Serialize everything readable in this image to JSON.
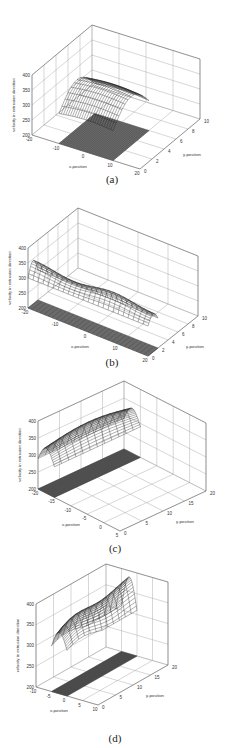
{
  "chart_data": [
    {
      "type": "surface3d",
      "caption": "(a)",
      "xlabel": "x-position",
      "ylabel": "y-position",
      "zlabel": "velocity in extrusion direction",
      "xlim": [
        -20,
        20
      ],
      "ylim": [
        0,
        10
      ],
      "zlim": [
        200,
        400
      ],
      "xticks": [
        -20,
        -10,
        0,
        10,
        20
      ],
      "yticks": [
        0,
        2,
        4,
        6,
        8,
        10
      ],
      "zticks": [
        200,
        250,
        300,
        350,
        400
      ],
      "surface": {
        "x_range": [
          -10,
          10
        ],
        "y_range": [
          0,
          6
        ],
        "z_edge": 300,
        "z_peak": 370,
        "shape": "arch"
      },
      "floor_patch": {
        "x_range": [
          -10,
          10
        ],
        "y_range": [
          0,
          6
        ]
      }
    },
    {
      "type": "surface3d",
      "caption": "(b)",
      "xlabel": "x-position",
      "ylabel": "y-position",
      "zlabel": "velocity in extrusion direction",
      "xlim": [
        -20,
        20
      ],
      "ylim": [
        0,
        10
      ],
      "zlim": [
        200,
        400
      ],
      "xticks": [
        -20,
        -10,
        0,
        10,
        20
      ],
      "yticks": [
        0,
        2,
        4,
        6,
        8,
        10
      ],
      "zticks": [
        200,
        250,
        300,
        350,
        400
      ],
      "surface": {
        "x_range": [
          -20,
          20
        ],
        "y_range": [
          0,
          2
        ],
        "z_edge": 300,
        "z_peak": 345,
        "shape": "wavy"
      },
      "floor_patch": {
        "x_range": [
          -20,
          20
        ],
        "y_range": [
          0,
          2
        ]
      }
    },
    {
      "type": "surface3d",
      "caption": "(c)",
      "xlabel": "x-position",
      "ylabel": "y-position",
      "zlabel": "velocity in extrusion direction",
      "xlim": [
        -20,
        5
      ],
      "ylim": [
        0,
        20
      ],
      "zlim": [
        200,
        400
      ],
      "xticks": [
        -20,
        -15,
        -10,
        -5,
        0,
        5
      ],
      "yticks": [
        0,
        5,
        10,
        15,
        20
      ],
      "zticks": [
        200,
        250,
        300,
        350,
        400
      ],
      "surface": {
        "x_range": [
          -20,
          -15
        ],
        "y_range": [
          0,
          20
        ],
        "z_edge": 290,
        "z_peak": 350,
        "shape": "arch-y"
      },
      "floor_patch": {
        "x_range": [
          -20,
          -15
        ],
        "y_range": [
          0,
          20
        ]
      }
    },
    {
      "type": "surface3d",
      "caption": "(d)",
      "xlabel": "x-position",
      "ylabel": "y-position",
      "zlabel": "velocity in extrusion direction",
      "xlim": [
        -10,
        10
      ],
      "ylim": [
        0,
        20
      ],
      "zlim": [
        200,
        400
      ],
      "xticks": [
        -10,
        -5,
        0,
        5,
        10
      ],
      "yticks": [
        0,
        5,
        10,
        15,
        20
      ],
      "zticks": [
        200,
        250,
        300,
        350,
        400
      ],
      "surface": {
        "x_range": [
          -5,
          0
        ],
        "y_range": [
          0,
          20
        ],
        "z_edge": 310,
        "z_peak": 385,
        "shape": "arch-y-rise"
      },
      "floor_patch": {
        "x_range": [
          -5,
          0
        ],
        "y_range": [
          0,
          20
        ]
      }
    }
  ]
}
